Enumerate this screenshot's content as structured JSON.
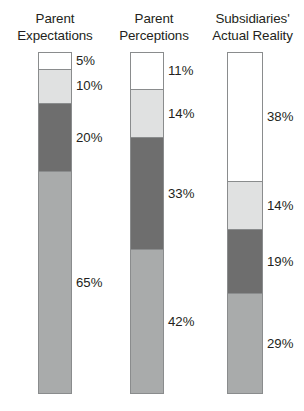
{
  "chart_data": {
    "type": "bar",
    "subtype": "stacked-100-percent",
    "title": "",
    "xlabel": "",
    "ylabel": "",
    "ylim": [
      0,
      100
    ],
    "grid": false,
    "legend": "none",
    "categories": [
      "Parent\nExpectations",
      "Parent\nPerceptions",
      "Subsidiaries'\nActual Reality"
    ],
    "series": [
      {
        "name": "segment-1",
        "color": "#ffffff",
        "values": [
          5,
          11,
          38
        ]
      },
      {
        "name": "segment-2",
        "color": "#e0e1e1",
        "values": [
          10,
          14,
          14
        ]
      },
      {
        "name": "segment-3",
        "color": "#6e6e6e",
        "values": [
          20,
          33,
          19
        ]
      },
      {
        "name": "segment-4",
        "color": "#a9abab",
        "values": [
          65,
          42,
          29
        ]
      }
    ],
    "columns": [
      {
        "title_line_1": "Parent",
        "title_line_2": "Expectations",
        "segments": [
          {
            "label": "5%",
            "value": 5,
            "color": "#ffffff"
          },
          {
            "label": "10%",
            "value": 10,
            "color": "#e0e1e1"
          },
          {
            "label": "20%",
            "value": 20,
            "color": "#6e6e6e"
          },
          {
            "label": "65%",
            "value": 65,
            "color": "#a9abab"
          }
        ]
      },
      {
        "title_line_1": "Parent",
        "title_line_2": "Perceptions",
        "segments": [
          {
            "label": "11%",
            "value": 11,
            "color": "#ffffff"
          },
          {
            "label": "14%",
            "value": 14,
            "color": "#e0e1e1"
          },
          {
            "label": "33%",
            "value": 33,
            "color": "#6e6e6e"
          },
          {
            "label": "42%",
            "value": 42,
            "color": "#a9abab"
          }
        ]
      },
      {
        "title_line_1": "Subsidiaries'",
        "title_line_2": "Actual Reality",
        "segments": [
          {
            "label": "38%",
            "value": 38,
            "color": "#ffffff"
          },
          {
            "label": "14%",
            "value": 14,
            "color": "#e0e1e1"
          },
          {
            "label": "19%",
            "value": 19,
            "color": "#6e6e6e"
          },
          {
            "label": "29%",
            "value": 29,
            "color": "#a9abab"
          }
        ]
      }
    ],
    "colors": {
      "segment_1": "#ffffff",
      "segment_2": "#e0e1e1",
      "segment_3": "#6e6e6e",
      "segment_4": "#a9abab",
      "outline": "#8a8c8d",
      "text": "#231f20",
      "background": "#ffffff"
    }
  }
}
